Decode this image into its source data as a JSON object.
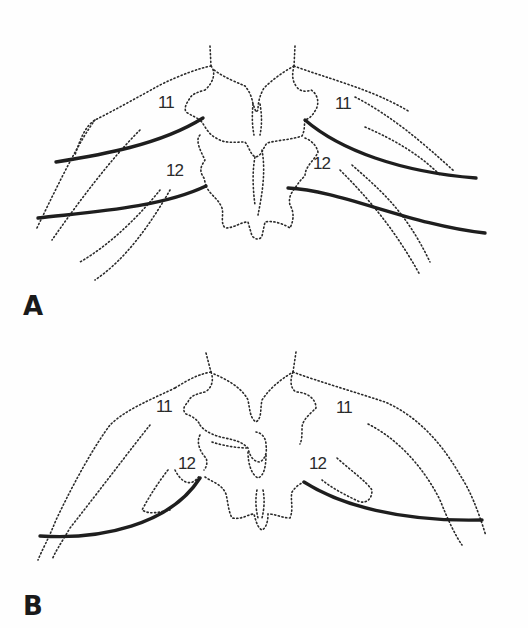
{
  "figure": {
    "panels": [
      {
        "label": "A",
        "vertebra_labels": {
          "upper_left": "11",
          "upper_right": "11",
          "lower_left": "12",
          "lower_right": "12"
        }
      },
      {
        "label": "B",
        "vertebra_labels": {
          "upper_left": "11",
          "upper_right": "11",
          "lower_left": "12",
          "lower_right": "12"
        }
      }
    ],
    "colors": {
      "line": "#1e1e1e",
      "dotted_outline": "#2a2a2a",
      "background": "#fefefe"
    }
  }
}
